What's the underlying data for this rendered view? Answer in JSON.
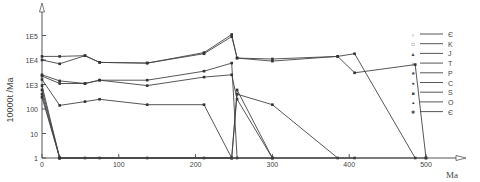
{
  "chart_data": {
    "type": "line",
    "title": "",
    "xlabel": "Ma",
    "ylabel": "10000t /Ma",
    "yscale": "log",
    "xlim": [
      0,
      520
    ],
    "ylim": [
      1,
      100000
    ],
    "x_ticks": [
      "0",
      "100",
      "200",
      "300",
      "400",
      "500"
    ],
    "y_ticks": [
      "1",
      "10",
      "100",
      "1E3",
      "1E4",
      "1E5"
    ],
    "grid": false,
    "legend_position": "right",
    "legend": [
      {
        "marker": "○",
        "label": "Є"
      },
      {
        "marker": "□",
        "label": "K"
      },
      {
        "marker": "▲",
        "label": "J"
      },
      {
        "marker": "◊",
        "label": "T"
      },
      {
        "marker": "★",
        "label": "P"
      },
      {
        "marker": "●",
        "label": "C"
      },
      {
        "marker": "■",
        "label": "S"
      },
      {
        "marker": "▴",
        "label": "O"
      },
      {
        "marker": "✱",
        "label": "Є"
      }
    ],
    "series": [
      {
        "name": "Є",
        "points": [
          [
            0,
            14000
          ],
          [
            23,
            14000
          ],
          [
            56,
            15000
          ],
          [
            75,
            8000
          ],
          [
            137,
            7500
          ],
          [
            211,
            20000
          ],
          [
            247,
            110000
          ],
          [
            254,
            12000
          ],
          [
            300,
            11000
          ],
          [
            385,
            14000
          ],
          [
            407,
            18000
          ],
          [
            486,
            1
          ]
        ]
      },
      {
        "name": "K",
        "points": [
          [
            0,
            10000
          ],
          [
            23,
            7000
          ],
          [
            56,
            15000
          ],
          [
            75,
            8000
          ],
          [
            137,
            7500
          ],
          [
            211,
            18000
          ],
          [
            247,
            90000
          ],
          [
            254,
            12000
          ],
          [
            300,
            9000
          ],
          [
            385,
            14000
          ],
          [
            407,
            3000
          ],
          [
            486,
            6500
          ],
          [
            500,
            1
          ]
        ]
      },
      {
        "name": "J",
        "points": [
          [
            0,
            2500
          ],
          [
            23,
            1400
          ],
          [
            56,
            1100
          ],
          [
            75,
            1500
          ],
          [
            137,
            1500
          ],
          [
            211,
            3500
          ],
          [
            247,
            7500
          ],
          [
            254,
            1
          ]
        ]
      },
      {
        "name": "T",
        "points": [
          [
            0,
            2200
          ],
          [
            23,
            1100
          ],
          [
            56,
            1100
          ],
          [
            75,
            1500
          ],
          [
            137,
            900
          ],
          [
            211,
            2000
          ],
          [
            247,
            2500
          ],
          [
            254,
            250
          ],
          [
            300,
            1
          ]
        ]
      },
      {
        "name": "P",
        "points": [
          [
            0,
            1600
          ],
          [
            23,
            140
          ],
          [
            56,
            200
          ],
          [
            75,
            250
          ],
          [
            137,
            150
          ],
          [
            211,
            150
          ],
          [
            247,
            1
          ]
        ]
      },
      {
        "name": "C",
        "points": [
          [
            0,
            900
          ],
          [
            23,
            1
          ],
          [
            56,
            1
          ],
          [
            75,
            1
          ],
          [
            137,
            1
          ],
          [
            211,
            1
          ],
          [
            247,
            1
          ],
          [
            254,
            400
          ],
          [
            300,
            150
          ],
          [
            385,
            1
          ]
        ]
      },
      {
        "name": "S",
        "points": [
          [
            0,
            600
          ],
          [
            23,
            1
          ],
          [
            247,
            1
          ],
          [
            254,
            600
          ],
          [
            300,
            1
          ]
        ]
      },
      {
        "name": "O",
        "points": [
          [
            0,
            400
          ],
          [
            23,
            1
          ],
          [
            300,
            1
          ],
          [
            407,
            1
          ]
        ]
      },
      {
        "name": "Є",
        "points": [
          [
            0,
            300
          ],
          [
            23,
            1
          ],
          [
            500,
            1
          ]
        ]
      }
    ]
  }
}
